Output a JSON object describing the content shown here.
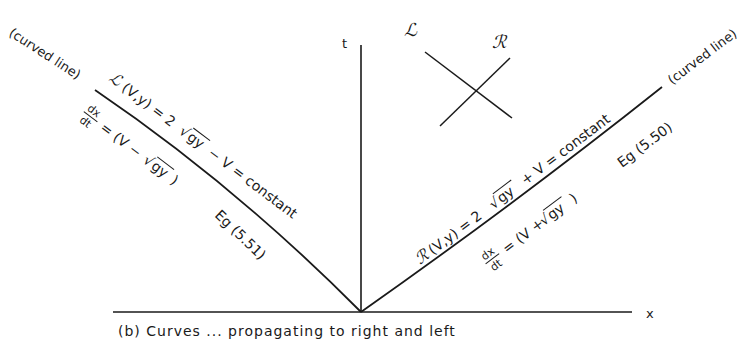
{
  "figure": {
    "axes": {
      "t_label": "t",
      "x_label": "x"
    },
    "inset": {
      "left_label": "ℒ",
      "right_label": "ℛ"
    },
    "left_characteristic": {
      "note": "(curved line)",
      "invariant_prefix": "ℒ",
      "invariant_args": "(V,y) = 2",
      "invariant_sqrt": "gy",
      "invariant_suffix": "− V = constant",
      "slope_num": "dx",
      "slope_den": "dt",
      "slope_expr_pre": "= (V −",
      "slope_sqrt": "gy",
      "slope_expr_post": ")",
      "equation_ref": "Eg (5.51)"
    },
    "right_characteristic": {
      "note": "(curved line)",
      "invariant_prefix": "ℛ",
      "invariant_args": "(V,y) = 2",
      "invariant_sqrt": "gy",
      "invariant_suffix": "+ V = constant",
      "slope_num": "dx",
      "slope_den": "dt",
      "slope_expr_pre": "= (V +",
      "slope_sqrt": "gy",
      "slope_expr_post": ")",
      "equation_ref": "Eg (5.50)"
    },
    "caption": "(b)  Curves  ...  propagating  to  right  and  left"
  },
  "colors": {
    "ink": "#1a1a1a",
    "paper": "#ffffff"
  }
}
